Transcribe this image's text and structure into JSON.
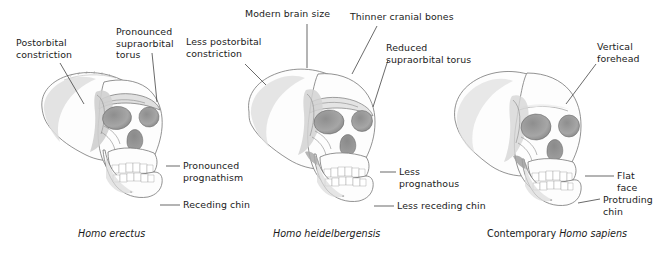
{
  "figure": {
    "style": "grayscale anatomical illustration, three-quarter view skulls",
    "background_color": "#ffffff",
    "text_color": "#1b1b1b",
    "leader_line_color": "#2a2a2a"
  },
  "specimens": [
    {
      "id": "homo-erectus",
      "caption_prefix": "",
      "caption_species": "Homo erectus",
      "labels": [
        {
          "name": "postorbital-constriction",
          "text": "Postorbital\nconstriction"
        },
        {
          "name": "pronounced-supraorbital-torus",
          "text": "Pronounced\nsupraorbital\ntorus"
        },
        {
          "name": "pronounced-prognathism",
          "text": "Pronounced\nprognathism"
        },
        {
          "name": "receding-chin",
          "text": "Receding chin"
        }
      ]
    },
    {
      "id": "homo-heidelbergensis",
      "caption_prefix": "",
      "caption_species": "Homo heidelbergensis",
      "labels": [
        {
          "name": "modern-brain-size",
          "text": "Modern brain size"
        },
        {
          "name": "thinner-cranial-bones",
          "text": "Thinner cranial bones"
        },
        {
          "name": "less-postorbital-constriction",
          "text": "Less postorbital\nconstriction"
        },
        {
          "name": "reduced-supraorbital-torus",
          "text": "Reduced\nsupraorbital torus"
        },
        {
          "name": "less-prognathous",
          "text": "Less\nprognathous"
        },
        {
          "name": "less-receding-chin",
          "text": "Less receding chin"
        }
      ]
    },
    {
      "id": "homo-sapiens",
      "caption_prefix": "Contemporary ",
      "caption_species": "Homo sapiens",
      "labels": [
        {
          "name": "vertical-forehead",
          "text": "Vertical\nforehead"
        },
        {
          "name": "flat-face",
          "text": "Flat\nface"
        },
        {
          "name": "protruding-chin",
          "text": "Protruding\nchin"
        }
      ]
    }
  ],
  "labels_flat": {
    "postorbital_constriction": "Postorbital\nconstriction",
    "pronounced_supraorbital_torus": "Pronounced\nsupraorbital\ntorus",
    "pronounced_prognathism": "Pronounced\nprognathism",
    "receding_chin": "Receding chin",
    "modern_brain_size": "Modern brain size",
    "thinner_cranial_bones": "Thinner cranial bones",
    "less_postorbital_constriction": "Less postorbital\nconstriction",
    "reduced_supraorbital_torus": "Reduced\nsupraorbital torus",
    "less_prognathous": "Less\nprognathous",
    "less_receding_chin": "Less receding chin",
    "vertical_forehead": "Vertical\nforehead",
    "flat_face": "Flat\nface",
    "protruding_chin": "Protruding\nchin"
  },
  "captions": {
    "erectus": "Homo erectus",
    "heidelbergensis": "Homo heidelbergensis",
    "sapiens_prefix": "Contemporary ",
    "sapiens_species": "Homo sapiens"
  }
}
